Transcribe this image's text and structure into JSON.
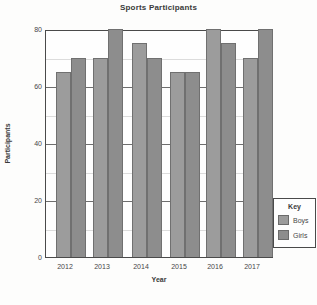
{
  "title": "Sports Participants",
  "chart_data": {
    "type": "bar",
    "categories": [
      "2012",
      "2013",
      "2014",
      "2015",
      "2016",
      "2017"
    ],
    "series": [
      {
        "name": "Boys",
        "values": [
          65,
          70,
          75,
          65,
          80,
          70
        ],
        "color": "#9c9c9c"
      },
      {
        "name": "Girls",
        "values": [
          70,
          80,
          70,
          65,
          75,
          80
        ],
        "color": "#8d8d8d"
      }
    ],
    "xlabel": "Year",
    "ylabel": "Participants",
    "ylim": [
      0,
      80
    ],
    "ytick_step": 20,
    "y_ticks": [
      0,
      20,
      40,
      60,
      80
    ],
    "minor_gridlines": [
      10,
      30,
      50,
      70
    ],
    "major_gridlines": [
      20,
      40,
      60
    ],
    "grid": true,
    "legend_position": "bottom-right"
  },
  "legend": {
    "title": "Key",
    "items": [
      {
        "label": "Boys",
        "color": "#9c9c9c"
      },
      {
        "label": "Girls",
        "color": "#8d8d8d"
      }
    ]
  }
}
